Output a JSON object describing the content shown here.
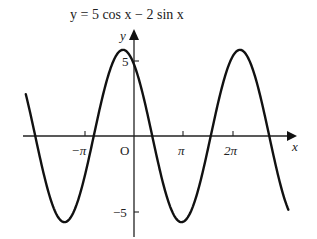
{
  "chart_data": {
    "type": "line",
    "title": "y = 5 cos x − 2 sin x",
    "xlabel": "x",
    "ylabel": "y",
    "origin_label": "O",
    "x_ticks": [
      {
        "value": -3.14159,
        "label": "−π"
      },
      {
        "value": 3.14159,
        "label": "π"
      },
      {
        "value": 6.28319,
        "label": "2π"
      }
    ],
    "y_ticks": [
      {
        "value": 5,
        "label": "5"
      },
      {
        "value": -5,
        "label": "−5"
      }
    ],
    "series": [
      {
        "name": "y = 5 cos x − 2 sin x",
        "expression": {
          "a_cos": 5,
          "b_sin": -2
        },
        "amplitude": 5.385,
        "x_range": [
          -5.6,
          8.5
        ],
        "color": "#111111",
        "points": [
          {
            "x": -5.6,
            "y": 2.31
          },
          {
            "x": -4.0,
            "y": -5.3
          },
          {
            "x": -3.52,
            "y": -5.39
          },
          {
            "x": -2.0,
            "y": -0.26
          },
          {
            "x": -0.38,
            "y": 5.39
          },
          {
            "x": 1.19,
            "y": 0.0
          },
          {
            "x": 2.76,
            "y": -5.39
          },
          {
            "x": 4.33,
            "y": 0.0
          },
          {
            "x": 5.9,
            "y": 5.39
          },
          {
            "x": 7.47,
            "y": 0.0
          },
          {
            "x": 8.5,
            "y": -4.96
          }
        ]
      }
    ],
    "ylim": [
      -6.5,
      7
    ],
    "grid": false,
    "legend": "none"
  },
  "labels": {
    "title": "y = 5 cos x − 2 sin x",
    "x_axis": "x",
    "y_axis": "y",
    "origin": "O",
    "tick_neg_pi": "−π",
    "tick_pi": "π",
    "tick_2pi": "2π",
    "tick_5": "5",
    "tick_neg5": "−5"
  }
}
